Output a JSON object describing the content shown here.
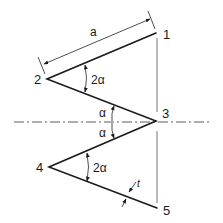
{
  "diagram": {
    "points": [
      {
        "id": "1",
        "label": "1"
      },
      {
        "id": "2",
        "label": "2"
      },
      {
        "id": "3",
        "label": "3"
      },
      {
        "id": "4",
        "label": "4"
      },
      {
        "id": "5",
        "label": "5"
      }
    ],
    "dimension_length": {
      "label": "a"
    },
    "angle_upper": {
      "label": "2α"
    },
    "angle_lower": {
      "label": "2α"
    },
    "angle_half_top": {
      "label": "α"
    },
    "angle_half_bottom": {
      "label": "α"
    },
    "thickness": {
      "label": "t"
    }
  }
}
